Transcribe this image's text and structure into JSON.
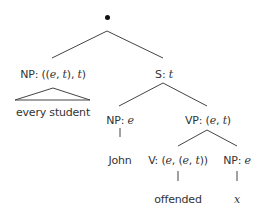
{
  "diagram": {
    "type": "syntax-tree",
    "root": {
      "symbol": "•"
    },
    "nodes": [
      {
        "id": "np-quant",
        "label": "NP: ((e, t), t)",
        "cat": "NP",
        "type": "((e, t), t)",
        "x": 53,
        "y": 68
      },
      {
        "id": "s",
        "label": "S: t",
        "cat": "S",
        "type": "t",
        "x": 164,
        "y": 68
      },
      {
        "id": "every-student",
        "label": "every student",
        "x": 53,
        "y": 106
      },
      {
        "id": "np-subj",
        "label": "NP: e",
        "cat": "NP",
        "type": "e",
        "x": 120,
        "y": 114
      },
      {
        "id": "vp",
        "label": "VP: (e, t)",
        "cat": "VP",
        "type": "(e, t)",
        "x": 208,
        "y": 114
      },
      {
        "id": "john",
        "label": "John",
        "x": 120,
        "y": 154
      },
      {
        "id": "v",
        "label": "V: (e, (e, t))",
        "cat": "V",
        "type": "(e, (e, t))",
        "x": 178,
        "y": 154
      },
      {
        "id": "np-obj",
        "label": "NP: e",
        "cat": "NP",
        "type": "e",
        "x": 237,
        "y": 154
      },
      {
        "id": "offended",
        "label": "offended",
        "x": 178,
        "y": 193
      },
      {
        "id": "x",
        "label": "x",
        "x": 237,
        "y": 193
      }
    ],
    "edge_color": "#444444",
    "text_color": "#333333"
  }
}
